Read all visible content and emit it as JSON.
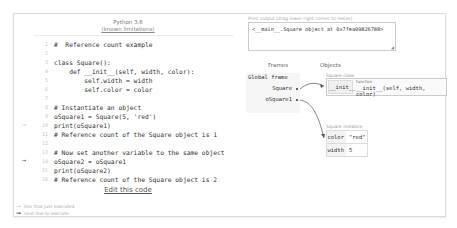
{
  "editor": {
    "language": "Python 3.6",
    "limitations_link": "(known limitations)",
    "lines": [
      {
        "n": "1",
        "text": "#  Reference count example",
        "marker": ""
      },
      {
        "n": "2",
        "text": "",
        "marker": ""
      },
      {
        "n": "3",
        "text": "class Square():",
        "marker": ""
      },
      {
        "n": "4",
        "text": "    def __init__(self, width, color):",
        "marker": ""
      },
      {
        "n": "5",
        "text": "        self.width = width",
        "marker": ""
      },
      {
        "n": "6",
        "text": "        self.color = color",
        "marker": ""
      },
      {
        "n": "7",
        "text": "",
        "marker": ""
      },
      {
        "n": "8",
        "text": "# Instantiate an object",
        "marker": ""
      },
      {
        "n": "9",
        "text": "oSquare1 = Square(5, 'red')",
        "marker": ""
      },
      {
        "n": "10",
        "text": "print(oSquare1)",
        "marker": "prev"
      },
      {
        "n": "11",
        "text": "# Reference count of the Square object is 1",
        "marker": ""
      },
      {
        "n": "12",
        "text": "",
        "marker": ""
      },
      {
        "n": "13",
        "text": "# Now set another variable to the same object",
        "marker": ""
      },
      {
        "n": "14",
        "text": "oSquare2 = oSquare1",
        "marker": "next"
      },
      {
        "n": "15",
        "text": "print(oSquare2)",
        "marker": ""
      },
      {
        "n": "16",
        "text": "# Reference count of the Square object is 2",
        "marker": ""
      }
    ],
    "edit_link": "Edit this code",
    "legend": {
      "prev_symbol": "→",
      "prev_label": "line that just executed",
      "next_symbol": "➞",
      "next_label": "next line to execute"
    }
  },
  "output": {
    "label": "Print output (drag lower right corner to resize)",
    "text": "<__main__.Square object at 0x7fea09826788>",
    "resize_grip": "◢"
  },
  "visualizer": {
    "frames_header": "Frames",
    "objects_header": "Objects",
    "global_frame": {
      "title": "Global frame",
      "vars": [
        "Square",
        "oSquare1"
      ]
    },
    "class_object": {
      "label": "Square class",
      "key": "__init__",
      "func_label": "function",
      "func_value": "__init__(self, width, color)"
    },
    "instance_object": {
      "label": "Square instance",
      "fields": [
        {
          "key": "color",
          "value": "\"red\""
        },
        {
          "key": "width",
          "value": "5"
        }
      ]
    }
  }
}
